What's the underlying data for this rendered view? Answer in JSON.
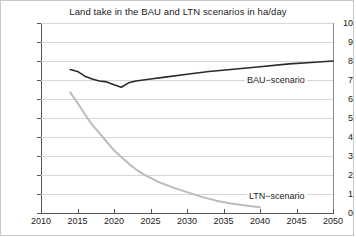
{
  "chart_data": {
    "type": "line",
    "title": "Land take in the BAU and LTN scenarios in ha/day",
    "xlabel": "",
    "ylabel": "",
    "xlim": [
      2010,
      2050
    ],
    "ylim": [
      0,
      10
    ],
    "grid": true,
    "legend_position": "inline-annotation",
    "x_ticks": [
      "2010",
      "2015",
      "2020",
      "2025",
      "2030",
      "2035",
      "2040",
      "2045",
      "2050"
    ],
    "y_ticks": [
      "0",
      "1",
      "2",
      "3",
      "4",
      "5",
      "6",
      "7",
      "8",
      "9",
      "10"
    ],
    "series": [
      {
        "name": "BAU−scenario",
        "color": "#2a2a2a",
        "x": [
          2014,
          2015,
          2016,
          2017,
          2018,
          2019,
          2020,
          2021,
          2022,
          2023,
          2025,
          2027,
          2030,
          2033,
          2036,
          2040,
          2044,
          2047,
          2050
        ],
        "values": [
          7.55,
          7.45,
          7.2,
          7.05,
          6.95,
          6.9,
          6.75,
          6.62,
          6.85,
          6.95,
          7.05,
          7.15,
          7.3,
          7.45,
          7.55,
          7.7,
          7.85,
          7.92,
          8.0
        ]
      },
      {
        "name": "LTN−scenario",
        "color": "#bcbcbc",
        "x": [
          2014,
          2015,
          2016,
          2017,
          2018,
          2019,
          2020,
          2021,
          2022,
          2023,
          2024,
          2025,
          2026,
          2028,
          2030,
          2032,
          2034,
          2036,
          2038,
          2040
        ],
        "values": [
          6.35,
          5.8,
          5.2,
          4.65,
          4.2,
          3.75,
          3.3,
          2.95,
          2.6,
          2.3,
          2.05,
          1.85,
          1.65,
          1.35,
          1.1,
          0.85,
          0.65,
          0.5,
          0.4,
          0.3
        ]
      }
    ],
    "annotations": [
      {
        "name": "bau-label",
        "text": "BAU−scenario"
      },
      {
        "name": "ltn-label",
        "text": "LTN−scenario"
      }
    ]
  }
}
